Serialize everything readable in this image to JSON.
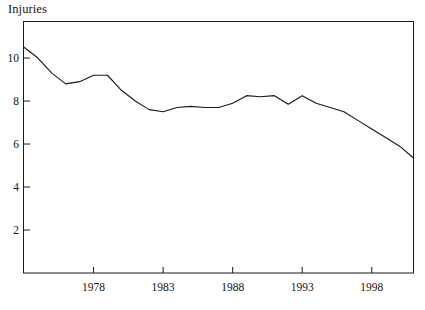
{
  "chart_data": {
    "type": "line",
    "title": "Injuries",
    "xlabel": "",
    "ylabel": "Injuries",
    "xlim": [
      1973,
      2001
    ],
    "ylim": [
      0,
      11.7
    ],
    "grid": false,
    "legend": null,
    "y_ticks": [
      2,
      4,
      6,
      8,
      10
    ],
    "y_tick_labels": [
      "2",
      "4",
      "6",
      "8",
      "10"
    ],
    "x_ticks": [
      1978,
      1983,
      1988,
      1993,
      1998
    ],
    "x_tick_labels": [
      "1978",
      "1983",
      "1988",
      "1993",
      "1998"
    ],
    "line_color": "#1a1a1a",
    "frame_color": "#1a1a1a",
    "series": [
      {
        "name": "Injuries",
        "x": [
          1973,
          1974,
          1975,
          1976,
          1977,
          1978,
          1979,
          1980,
          1981,
          1982,
          1983,
          1984,
          1985,
          1986,
          1987,
          1988,
          1989,
          1990,
          1991,
          1992,
          1993,
          1994,
          1995,
          1996,
          1997,
          1998,
          1999,
          2000,
          2001
        ],
        "values": [
          10.5,
          10.0,
          9.3,
          8.8,
          8.9,
          9.2,
          9.2,
          8.5,
          8.0,
          7.6,
          7.5,
          7.7,
          7.75,
          7.7,
          7.7,
          7.9,
          8.25,
          8.2,
          8.25,
          7.85,
          8.25,
          7.9,
          7.7,
          7.5,
          7.1,
          6.7,
          6.3,
          5.9,
          5.35
        ]
      }
    ]
  }
}
